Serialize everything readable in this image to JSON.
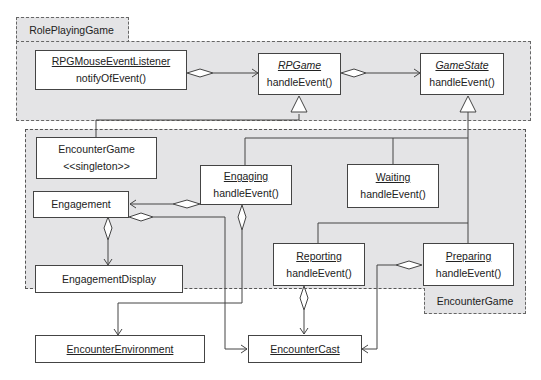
{
  "packages": {
    "role_playing_game": {
      "label": "RolePlayingGame"
    },
    "encounter_game": {
      "label": "EncounterGame"
    }
  },
  "classes": {
    "rpg_mouse_listener": {
      "name": "RPGMouseEventListener",
      "op": "notifyOfEvent()"
    },
    "rpgame": {
      "name": "RPGame",
      "op": "handleEvent()"
    },
    "game_state": {
      "name": "GameState",
      "op": "handleEvent()"
    },
    "encounter_game": {
      "name": "EncounterGame",
      "stereotype": "<<singleton>>"
    },
    "engaging": {
      "name": "Engaging",
      "op": "handleEvent()"
    },
    "waiting": {
      "name": "Waiting",
      "op": "handleEvent()"
    },
    "engagement": {
      "name": "Engagement"
    },
    "engagement_display": {
      "name": "EngagementDisplay"
    },
    "reporting": {
      "name": "Reporting",
      "op": "handleEvent()"
    },
    "preparing": {
      "name": "Preparing",
      "op": "handleEvent()"
    },
    "encounter_environment": {
      "name": "EncounterEnvironment"
    },
    "encounter_cast": {
      "name": "EncounterCast"
    }
  },
  "colors": {
    "package_fill": "#e4e4e6",
    "line": "#444444"
  }
}
